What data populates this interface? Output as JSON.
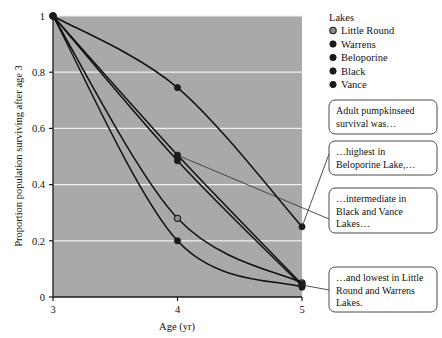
{
  "chart_data": {
    "type": "line",
    "title": "",
    "xlabel": "Age (yr)",
    "ylabel": "Proportion population surviving after age 3",
    "x": [
      3,
      4,
      5
    ],
    "xticks": [
      "3",
      "4",
      "5"
    ],
    "yticks": [
      "0",
      "0.2",
      "0.4",
      "0.6",
      "0.8",
      "1"
    ],
    "xlim": [
      3,
      5
    ],
    "ylim": [
      0,
      1
    ],
    "grid": true,
    "legend_position": "right",
    "legend_title": "Lakes",
    "series": [
      {
        "name": "Little Round",
        "marker": "open-circle",
        "values": [
          1,
          0.28,
          0.05
        ]
      },
      {
        "name": "Warrens",
        "marker": "filled-circle",
        "values": [
          1,
          0.2,
          0.035
        ]
      },
      {
        "name": "Beloporine",
        "marker": "filled-circle",
        "values": [
          1,
          0.745,
          0.25
        ]
      },
      {
        "name": "Black",
        "marker": "filled-circle",
        "values": [
          1,
          0.505,
          0.045
        ]
      },
      {
        "name": "Vance",
        "marker": "filled-circle",
        "values": [
          1,
          0.485,
          0.04
        ]
      }
    ]
  },
  "legend": {
    "title": "Lakes",
    "items": [
      {
        "label": "Little Round"
      },
      {
        "label": "Warrens"
      },
      {
        "label": "Beloporine"
      },
      {
        "label": "Black"
      },
      {
        "label": "Vance"
      }
    ]
  },
  "callouts": [
    {
      "lines": [
        "Adult pumpkinseed",
        "survival was…"
      ]
    },
    {
      "lines": [
        "…highest in",
        "Beloporine Lake,…"
      ]
    },
    {
      "lines": [
        "…intermediate in",
        "Black and Vance",
        "Lakes…"
      ]
    },
    {
      "lines": [
        "…and lowest in Little",
        "Round and Warrens",
        "Lakes."
      ]
    }
  ],
  "colors": {
    "plot_background": "#a9a9a9",
    "gridline": "#f0f0f0",
    "axis": "#1a1a1a",
    "line": "#111111",
    "marker_filled": "#1a1a1a",
    "marker_open": "#8d8d8d",
    "callout_border": "#4a4a4a",
    "page_background": "#ffffff"
  }
}
